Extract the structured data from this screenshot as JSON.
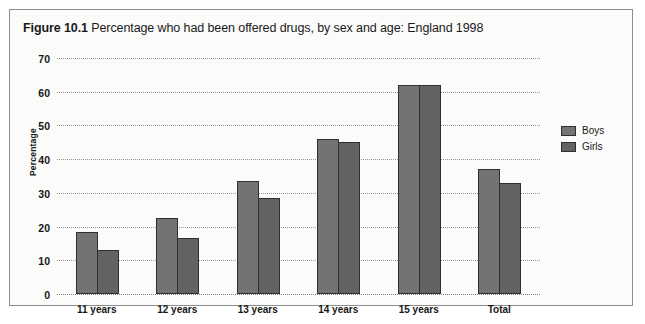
{
  "figure": {
    "number": "Figure 10.1",
    "title": "Percentage who had been offered drugs, by sex and age: England 1998"
  },
  "legend": {
    "position": "right",
    "items": [
      {
        "label": "Boys",
        "color": "#737373"
      },
      {
        "label": "Girls",
        "color": "#626262"
      }
    ]
  },
  "axis": {
    "y_title": "Percentage",
    "y_ticks": [
      "0",
      "10",
      "20",
      "30",
      "40",
      "50",
      "60",
      "70"
    ]
  },
  "chart_data": {
    "type": "bar",
    "title": "Figure 10.1 Percentage who had been offered drugs, by sex and age: England 1998",
    "xlabel": "",
    "ylabel": "Percentage",
    "ylim": [
      0,
      70
    ],
    "ytick_step": 10,
    "grid": true,
    "legend_position": "right",
    "categories": [
      "11 years",
      "12 years",
      "13 years",
      "14 years",
      "15 years",
      "Total"
    ],
    "series": [
      {
        "name": "Boys",
        "color": "#737373",
        "values": [
          18.5,
          22.5,
          33.5,
          46,
          62,
          37
        ]
      },
      {
        "name": "Girls",
        "color": "#626262",
        "values": [
          13,
          16.5,
          28.5,
          45,
          62,
          33
        ]
      }
    ]
  }
}
